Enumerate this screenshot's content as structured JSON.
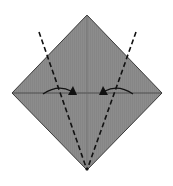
{
  "diagram": {
    "colors": {
      "paper_fill": "#8c8c8c",
      "outline": "#3a3a3a",
      "crease": "#5a5a5a",
      "fold_line": "#111111",
      "arrow": "#111111",
      "background": "#ffffff"
    },
    "elements": {
      "paper": "diamond-square",
      "creases": [
        "horizontal-center-crease",
        "vertical-center-crease"
      ],
      "fold_lines": [
        {
          "name": "left-valley-fold",
          "style": "dashed"
        },
        {
          "name": "right-valley-fold",
          "style": "dashed"
        }
      ],
      "arrows": [
        {
          "name": "left-fold-arrow",
          "direction": "right"
        },
        {
          "name": "right-fold-arrow",
          "direction": "left"
        }
      ]
    }
  }
}
